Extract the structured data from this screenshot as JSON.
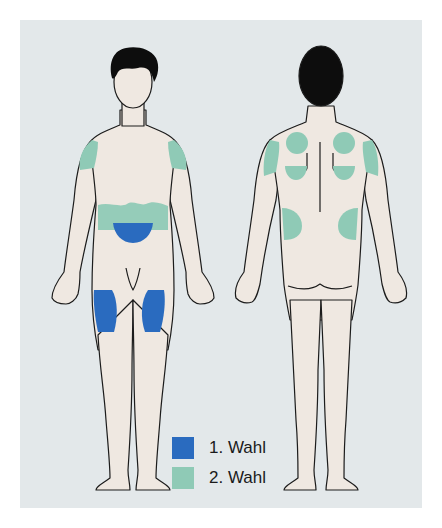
{
  "diagram": {
    "figures": [
      {
        "id": "front",
        "label": "front view"
      },
      {
        "id": "back",
        "label": "back view"
      }
    ],
    "colors": {
      "first_choice": "#2a6bbf",
      "second_choice": "#8fcab6",
      "skin": "#efe8e1",
      "outline": "#1c1c1c",
      "hair": "#0d0d0d",
      "panel_bg": "#e3e8ea"
    }
  },
  "legend": {
    "items": [
      {
        "label": "1. Wahl",
        "color": "#2a6bbf"
      },
      {
        "label": "2. Wahl",
        "color": "#8fcab6"
      }
    ]
  }
}
